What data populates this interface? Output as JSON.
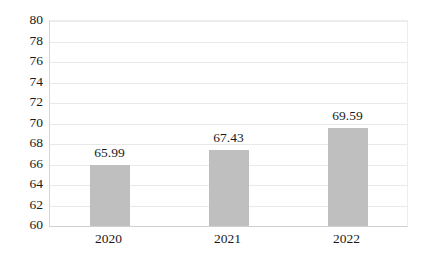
{
  "chart_data": {
    "type": "bar",
    "title": "",
    "subtitle": "",
    "xlabel": "",
    "ylabel": "",
    "categories": [
      "2020",
      "2021",
      "2022"
    ],
    "values": [
      65.99,
      67.43,
      69.59
    ],
    "data_labels": [
      "65.99",
      "67.43",
      "69.59"
    ],
    "series": [
      {
        "name": "",
        "values": [
          65.99,
          67.43,
          69.59
        ],
        "color": "#BFBFBF"
      }
    ],
    "ylim": [
      60,
      80
    ],
    "ytick_step": 2,
    "ytick_labels": [
      "60",
      "62",
      "64",
      "66",
      "68",
      "70",
      "72",
      "74",
      "76",
      "78",
      "80"
    ],
    "ytick_values": [
      60,
      62,
      64,
      66,
      68,
      70,
      72,
      74,
      76,
      78,
      80
    ],
    "grid": {
      "horizontal": true,
      "vertical": false,
      "color": "#E9E9E9"
    },
    "legend": {
      "visible": false,
      "position": "none",
      "entries": []
    },
    "plot_background": "#FFFFFF",
    "axis_line_color": "#D0D0D0",
    "data_label_color": "#1A1A1A",
    "tick_label_color": "#1A1A1A"
  }
}
